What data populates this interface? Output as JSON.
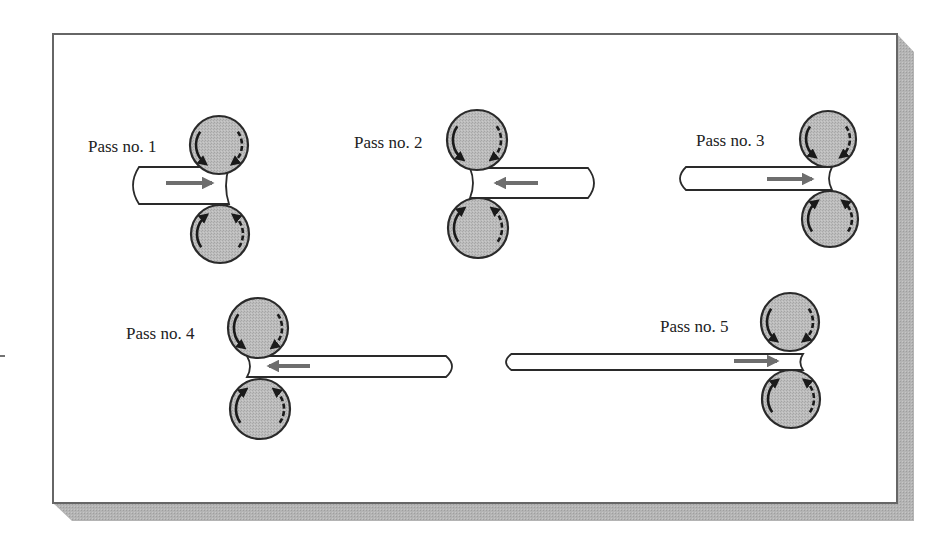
{
  "diagram": {
    "type": "reversing rolling mill passes",
    "colors": {
      "roll_fill": "#b8b8b8",
      "roll_outline": "#2a2a2a",
      "arrow": "#6e6e6e",
      "bar_fill": "#ffffff",
      "bar_outline": "#2a2a2a",
      "frame_outline": "#555555",
      "shadow": "#b0b0b0"
    },
    "passes": [
      {
        "label": "Pass no. 1",
        "direction": "right",
        "label_pos": [
          88,
          152
        ],
        "top_roll": [
          219,
          145,
          29
        ],
        "bottom_roll": [
          220,
          234,
          29
        ],
        "bar": {
          "x1": 133,
          "x2": 229,
          "y1": 167,
          "y2": 204
        },
        "arrow": {
          "x1": 166,
          "x2": 212,
          "y": 183
        }
      },
      {
        "label": "Pass no. 2",
        "direction": "left",
        "label_pos": [
          354,
          148
        ],
        "top_roll": [
          477,
          140,
          30
        ],
        "bottom_roll": [
          478,
          228,
          30
        ],
        "bar": {
          "x1": 470,
          "x2": 594,
          "y1": 168,
          "y2": 198
        },
        "arrow": {
          "x1": 538,
          "x2": 496,
          "y": 183
        }
      },
      {
        "label": "Pass no. 3",
        "direction": "right",
        "label_pos": [
          696,
          146
        ],
        "top_roll": [
          828,
          139,
          28
        ],
        "bottom_roll": [
          830,
          219,
          28
        ],
        "bar": {
          "x1": 680,
          "x2": 832,
          "y1": 167,
          "y2": 190
        },
        "arrow": {
          "x1": 767,
          "x2": 812,
          "y": 179
        }
      },
      {
        "label": "Pass no. 4",
        "direction": "left",
        "label_pos": [
          126,
          339
        ],
        "top_roll": [
          258,
          328,
          30
        ],
        "bottom_roll": [
          260,
          409,
          30
        ],
        "bar": {
          "x1": 247,
          "x2": 452,
          "y1": 356,
          "y2": 377
        },
        "arrow": {
          "x1": 310,
          "x2": 269,
          "y": 366
        }
      },
      {
        "label": "Pass no. 5",
        "direction": "right",
        "label_pos": [
          660,
          332
        ],
        "top_roll": [
          790,
          322,
          29
        ],
        "bottom_roll": [
          791,
          399,
          29
        ],
        "bar": {
          "x1": 506,
          "x2": 803,
          "y1": 354,
          "y2": 370
        },
        "arrow": {
          "x1": 734,
          "x2": 777,
          "y": 361
        }
      }
    ]
  }
}
